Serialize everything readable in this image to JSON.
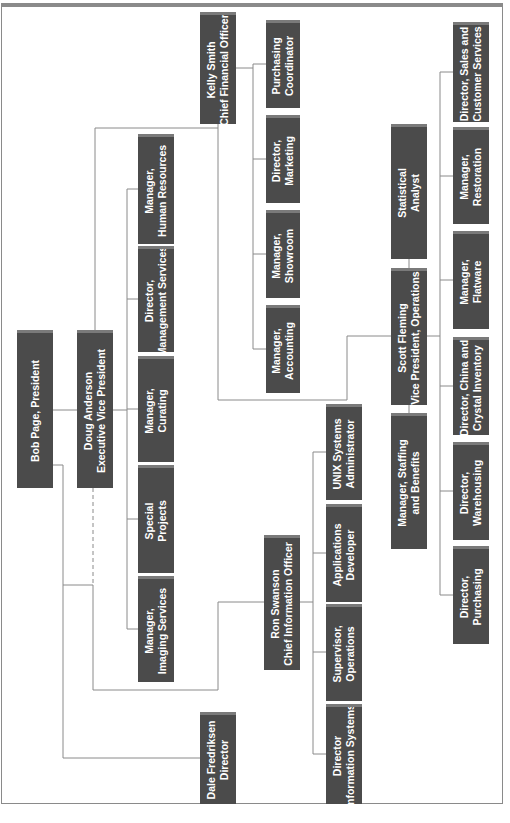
{
  "chart": {
    "orientation": "rotated-90-ccw",
    "colors": {
      "box_fill": "#4b4b4b",
      "box_top_strip": "#7a7a7a",
      "box_text": "#ffffff",
      "line": "#8a8a8a",
      "frame": "#8a8a8a"
    },
    "nodes": {
      "bob_page": {
        "line1": "Bob Page, President",
        "line2": ""
      },
      "doug_anderson": {
        "line1": "Doug Anderson",
        "line2": "Executive Vice President"
      },
      "kelly_smith": {
        "line1": "Kelly Smith",
        "line2": "Chief Financial Officer"
      },
      "purchasing_coordinator": {
        "line1": "Purchasing",
        "line2": "Coordinator"
      },
      "director_marketing": {
        "line1": "Director,",
        "line2": "Marketing"
      },
      "manager_showroom": {
        "line1": "Manager,",
        "line2": "Showroom"
      },
      "manager_accounting": {
        "line1": "Manager,",
        "line2": "Accounting"
      },
      "manager_hr": {
        "line1": "Manager,",
        "line2": "Human Resources"
      },
      "director_mgmt_services": {
        "line1": "Director,",
        "line2": "Management Services"
      },
      "manager_curating": {
        "line1": "Manager,",
        "line2": "Curating"
      },
      "special_projects": {
        "line1": "Special",
        "line2": "Projects"
      },
      "manager_imaging": {
        "line1": "Manager,",
        "line2": "Imaging Services"
      },
      "scott_fleming": {
        "line1": "Scott Fleming",
        "line2": "Vice President, Operations"
      },
      "statistical_analyst": {
        "line1": "Statistical",
        "line2": "Analyst"
      },
      "manager_staffing": {
        "line1": "Manager, Staffing",
        "line2": "and Benefits"
      },
      "director_sales": {
        "line1": "Director, Sales and",
        "line2": "Customer Services"
      },
      "manager_restoration": {
        "line1": "Manager,",
        "line2": "Restoration"
      },
      "manager_flatware": {
        "line1": "Manager,",
        "line2": "Flatware"
      },
      "director_china": {
        "line1": "Director, China and",
        "line2": "Crystal Inventory"
      },
      "director_warehousing": {
        "line1": "Director,",
        "line2": "Warehousing"
      },
      "director_purchasing": {
        "line1": "Director,",
        "line2": "Purchasing"
      },
      "ron_swanson": {
        "line1": "Ron Swanson",
        "line2": "Chief Information Officer"
      },
      "unix_admin": {
        "line1": "UNIX Systems",
        "line2": "Administrator"
      },
      "applications_developer": {
        "line1": "Applications",
        "line2": "Developer"
      },
      "supervisor_operations": {
        "line1": "Supervisor,",
        "line2": "Operations"
      },
      "director_info_systems": {
        "line1": "Director",
        "line2": "Information Systems"
      },
      "dale_fredriksen": {
        "line1": "Dale Fredriksen",
        "line2": "Director"
      }
    },
    "hierarchy": {
      "Bob Page, President": [
        "Doug Anderson",
        "Dale Fredriksen"
      ],
      "Doug Anderson": [
        "Kelly Smith",
        "Scott Fleming",
        "Ron Swanson",
        "Manager, Human Resources",
        "Director, Management Services",
        "Manager, Curating",
        "Special Projects",
        "Manager, Imaging Services"
      ],
      "Kelly Smith": [
        "Purchasing Coordinator",
        "Director, Marketing",
        "Manager, Showroom",
        "Manager, Accounting"
      ],
      "Scott Fleming": [
        "Statistical Analyst",
        "Manager, Staffing and Benefits",
        "Director, Sales and Customer Services",
        "Manager, Restoration",
        "Manager, Flatware",
        "Director, China and Crystal Inventory",
        "Director, Warehousing",
        "Director, Purchasing"
      ],
      "Ron Swanson": [
        "UNIX Systems Administrator",
        "Applications Developer",
        "Supervisor, Operations",
        "Director Information Systems"
      ]
    }
  }
}
